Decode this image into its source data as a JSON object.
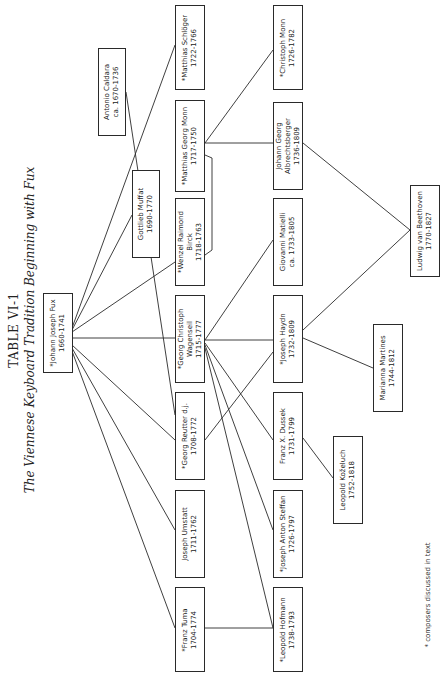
{
  "title": "TABLE VI-1",
  "subtitle": "The Viennese Keyboard Tradition Beginning with Fux",
  "footnote": "* composers discussed in text",
  "composers": {
    "fux": {
      "name": "*Johann Joseph Fux",
      "dates": "1660-1741"
    },
    "caldara": {
      "name": "Antonio Caldara",
      "dates": "ca. 1670-1736"
    },
    "muffat": {
      "name": "Gottlieb Muffat",
      "dates": "1690-1770"
    },
    "schloger": {
      "name": "*Matthias Schlöger",
      "dates": "1722-1766"
    },
    "mgmonn": {
      "name": "*Matthias Georg Monn",
      "dates": "1717-1750"
    },
    "birck": {
      "name": "*Wenzel Raimond",
      "name2": "Birck",
      "dates": "1718-1763"
    },
    "wagenseil": {
      "name": "*Georg Christoph",
      "name2": "Wagenseil",
      "dates": "1715-1777"
    },
    "reutter": {
      "name": "*Georg Reutter d.j.",
      "dates": "1708-1772"
    },
    "umstatt": {
      "name": "Joseph Umstatt",
      "dates": "1711-1762"
    },
    "tuma": {
      "name": "*Franz Tuma",
      "dates": "1704-1774"
    },
    "cmonn": {
      "name": "*Christoph Monn",
      "dates": "1726-1782"
    },
    "albrechtsberger": {
      "name": "Johann Georg",
      "name2": "Albrechtsberger",
      "dates": "1736-1809"
    },
    "matielli": {
      "name": "Giovanni Matielli",
      "dates": "ca. 1733-1805"
    },
    "haydn": {
      "name": "*Joseph Haydn",
      "dates": "1732-1809"
    },
    "dussek": {
      "name": "Franz X. Dussek",
      "dates": "1731-1799"
    },
    "stefan": {
      "name": "*Joseph Anton Steffan",
      "dates": "1726-1797"
    },
    "hofmann": {
      "name": "*Leopold Hofmann",
      "dates": "1738-1793"
    },
    "beethoven": {
      "name": "Ludwig van Beethoven",
      "dates": "1770-1827"
    },
    "martines": {
      "name": "Marianna Martines",
      "dates": "1744-1812"
    },
    "kozeluch": {
      "name": "Leopold Koželuch",
      "dates": "1752-1818"
    }
  },
  "connections": [
    [
      "fux",
      "schloger"
    ],
    [
      "fux",
      "muffat"
    ],
    [
      "fux",
      "birck"
    ],
    [
      "fux",
      "wagenseil"
    ],
    [
      "fux",
      "reutter"
    ],
    [
      "fux",
      "umstatt"
    ],
    [
      "fux",
      "tuma"
    ],
    [
      "caldara",
      "reutter"
    ],
    [
      "mgmonn",
      "birck"
    ],
    [
      "mgmonn",
      "albrechtsberger"
    ],
    [
      "mgmonn",
      "cmonn"
    ],
    [
      "wagenseil",
      "matielli"
    ],
    [
      "wagenseil",
      "haydn"
    ],
    [
      "wagenseil",
      "dussek"
    ],
    [
      "wagenseil",
      "stefan"
    ],
    [
      "wagenseil",
      "hofmann"
    ],
    [
      "reutter",
      "haydn"
    ],
    [
      "umstatt",
      "hofmann"
    ],
    [
      "tuma",
      "hofmann"
    ],
    [
      "albrechtsberger",
      "beethoven"
    ],
    [
      "haydn",
      "beethoven"
    ],
    [
      "haydn",
      "martines"
    ],
    [
      "dussek",
      "kozeluch"
    ]
  ]
}
